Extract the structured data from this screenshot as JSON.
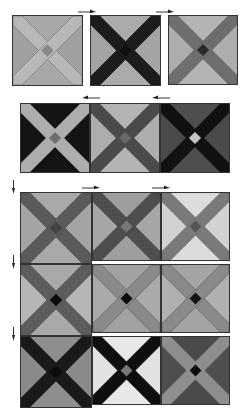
{
  "diagram": {
    "row1": [
      {
        "id": "r1b1",
        "x": 12,
        "y": 15,
        "size": 71,
        "tri_top": "#a8a8a8",
        "tri_side": "#a0a0a0",
        "band": "#b8b8b8",
        "band_edge": "#6a6a6a",
        "center": "#888888"
      },
      {
        "id": "r1b2",
        "x": 90,
        "y": 15,
        "size": 71,
        "tri_top": "#ababab",
        "tri_side": "#a4a4a4",
        "band": "#1c1c1c",
        "band_edge": "#1c1c1c",
        "center": "#101010"
      },
      {
        "id": "r1b3",
        "x": 168,
        "y": 15,
        "size": 70,
        "tri_top": "#b4b4b4",
        "tri_side": "#adadad",
        "band": "#6e6e6e",
        "band_edge": "#5a5a5a",
        "center": "#2a2a2a"
      }
    ],
    "row2": [
      {
        "id": "r2b1",
        "x": 20,
        "y": 103,
        "size": 70,
        "tri_top": "#141414",
        "tri_side": "#141414",
        "band": "#adadad",
        "band_edge": "#adadad",
        "center": "#6e6e6e"
      },
      {
        "id": "r2b2",
        "x": 90,
        "y": 103,
        "size": 70,
        "tri_top": "#b4b4b4",
        "tri_side": "#adadad",
        "band": "#4a4a4a",
        "band_edge": "#4a4a4a",
        "center": "#6a6a6a"
      },
      {
        "id": "r2b3",
        "x": 160,
        "y": 103,
        "size": 70,
        "tri_top": "#4e4e4e",
        "tri_side": "#4a4a4a",
        "band": "#111111",
        "band_edge": "#111111",
        "center": "#c4c4c4"
      }
    ],
    "grid": [
      {
        "id": "g1",
        "x": 20,
        "y": 192,
        "size": 72,
        "tri_top": "#a9a9a9",
        "tri_side": "#a4a4a4",
        "band": "#5a5a5a",
        "band_edge": "#444444",
        "center": "#444444"
      },
      {
        "id": "g2",
        "x": 92,
        "y": 192,
        "size": 69,
        "tri_top": "#9e9e9e",
        "tri_side": "#a6a6a6",
        "band": "#4e4e4e",
        "band_edge": "#3c3c3c",
        "center": "#777777"
      },
      {
        "id": "g3",
        "x": 161,
        "y": 192,
        "size": 69,
        "tri_top": "#dcdcdc",
        "tri_side": "#d2d2d2",
        "band": "#7a7a7a",
        "band_edge": "#666666",
        "center": "#555555"
      },
      {
        "id": "g4",
        "x": 20,
        "y": 264,
        "size": 72,
        "tri_top": "#a9a9a9",
        "tri_side": "#b6b6b6",
        "band": "#5c5c5c",
        "band_edge": "#555555",
        "center": "#0c0c0c"
      },
      {
        "id": "g5",
        "x": 92,
        "y": 264,
        "size": 69,
        "tri_top": "#a2a2a2",
        "tri_side": "#aaaaaa",
        "band": "#8a8a8a",
        "band_edge": "#555555",
        "center": "#0a0a0a"
      },
      {
        "id": "g6",
        "x": 161,
        "y": 264,
        "size": 69,
        "tri_top": "#a4a4a4",
        "tri_side": "#b0b0b0",
        "band": "#8a8a8a",
        "band_edge": "#555555",
        "center": "#151515"
      },
      {
        "id": "g7",
        "x": 20,
        "y": 336,
        "size": 72,
        "tri_top": "#8e8e8e",
        "tri_side": "#8a8a8a",
        "band": "#1a1a1a",
        "band_edge": "#1a1a1a",
        "center": "#0a0a0a"
      },
      {
        "id": "g8",
        "x": 92,
        "y": 336,
        "size": 69,
        "tri_top": "#e8e8e8",
        "tri_side": "#e2e2e2",
        "band": "#0e0e0e",
        "band_edge": "#0e0e0e",
        "center": "#777777"
      },
      {
        "id": "g9",
        "x": 161,
        "y": 336,
        "size": 69,
        "tri_top": "#4a4a4a",
        "tri_side": "#4e4e4e",
        "band": "#8e8e8e",
        "band_edge": "#8e8e8e",
        "center": "#0c0c0c"
      }
    ],
    "arrows": [
      {
        "id": "a1",
        "x": 78,
        "y": 9,
        "dir": "right"
      },
      {
        "id": "a2",
        "x": 156,
        "y": 9,
        "dir": "right"
      },
      {
        "id": "a3",
        "x": 82,
        "y": 95,
        "dir": "left"
      },
      {
        "id": "a4",
        "x": 152,
        "y": 95,
        "dir": "left"
      },
      {
        "id": "a5",
        "x": 11,
        "y": 180,
        "dir": "down"
      },
      {
        "id": "a6",
        "x": 82,
        "y": 185,
        "dir": "right"
      },
      {
        "id": "a7",
        "x": 152,
        "y": 185,
        "dir": "right"
      },
      {
        "id": "a8",
        "x": 11,
        "y": 255,
        "dir": "down"
      },
      {
        "id": "a9",
        "x": 11,
        "y": 327,
        "dir": "down"
      }
    ]
  }
}
